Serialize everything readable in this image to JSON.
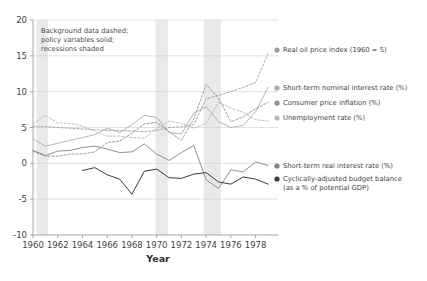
{
  "chart_data": {
    "type": "line",
    "title": "",
    "xlabel": "Year",
    "ylabel": "",
    "xlim": [
      1960,
      1979
    ],
    "ylim": [
      -10,
      20
    ],
    "xticks": [
      1960,
      1962,
      1964,
      1966,
      1968,
      1970,
      1972,
      1974,
      1976,
      1978
    ],
    "yticks": [
      -10,
      -5,
      0,
      5,
      10,
      15,
      20
    ],
    "xticklabels": [
      "1960",
      "1962",
      "1964",
      "1966",
      "1968",
      "1970",
      "1972",
      "1974",
      "1976",
      "1978"
    ],
    "yticklabels": [
      "-10",
      "-5",
      "0",
      "5",
      "10",
      "15",
      "20"
    ],
    "grid": true,
    "legend_position": "right",
    "annotation": {
      "lines": [
        "Background data dashed;",
        "policy variables solid;",
        "recessions shaded"
      ]
    },
    "recessions": [
      {
        "start": 1960.3,
        "end": 1961.2
      },
      {
        "start": 1969.9,
        "end": 1970.9
      },
      {
        "start": 1973.8,
        "end": 1975.2
      }
    ],
    "series": [
      {
        "name": "Real oil price index (1960 = 5)",
        "style": "dashed",
        "color": "#9aa0a6",
        "x": [
          1960,
          1961,
          1962,
          1963,
          1964,
          1965,
          1966,
          1967,
          1968,
          1969,
          1970,
          1971,
          1972,
          1973,
          1974,
          1975,
          1976,
          1977,
          1978,
          1979
        ],
        "values": [
          5.2,
          5.1,
          5.0,
          4.9,
          4.8,
          4.7,
          4.6,
          4.6,
          4.5,
          4.4,
          4.6,
          5.0,
          5.1,
          5.4,
          9.0,
          9.5,
          10.0,
          10.6,
          11.3,
          15.3
        ]
      },
      {
        "name": "Short-term nominal interest rate (%)",
        "style": "solid",
        "color": "#a7adb3",
        "x": [
          1960,
          1961,
          1962,
          1963,
          1964,
          1965,
          1966,
          1967,
          1968,
          1969,
          1970,
          1971,
          1972,
          1973,
          1974,
          1975,
          1976,
          1977,
          1978,
          1979
        ],
        "values": [
          3.4,
          2.4,
          2.8,
          3.2,
          3.6,
          4.0,
          4.9,
          4.3,
          5.4,
          6.7,
          6.4,
          4.3,
          4.1,
          7.0,
          7.9,
          5.8,
          5.0,
          5.3,
          7.2,
          10.6
        ]
      },
      {
        "name": "Consumer price inflation (%)",
        "style": "dashed",
        "color": "#8b9096",
        "x": [
          1960,
          1961,
          1962,
          1963,
          1964,
          1965,
          1966,
          1967,
          1968,
          1969,
          1970,
          1971,
          1972,
          1973,
          1974,
          1975,
          1976,
          1977,
          1978,
          1979
        ],
        "values": [
          1.7,
          1.0,
          1.0,
          1.3,
          1.3,
          1.6,
          2.9,
          3.1,
          4.2,
          5.5,
          5.7,
          4.4,
          3.2,
          6.2,
          11.0,
          9.1,
          5.8,
          6.5,
          7.6,
          8.5
        ]
      },
      {
        "name": "Unemployment rate (%)",
        "style": "dashed",
        "color": "#b4b9be",
        "x": [
          1960,
          1961,
          1962,
          1963,
          1964,
          1965,
          1966,
          1967,
          1968,
          1969,
          1970,
          1971,
          1972,
          1973,
          1974,
          1975,
          1976,
          1977,
          1978,
          1979
        ],
        "values": [
          5.5,
          6.7,
          5.6,
          5.6,
          5.2,
          4.5,
          3.8,
          3.8,
          3.6,
          3.5,
          4.9,
          5.9,
          5.6,
          4.9,
          5.6,
          8.5,
          7.7,
          7.1,
          6.1,
          5.9
        ]
      },
      {
        "name": "Short-term real interest rate (%)",
        "style": "solid",
        "color": "#7d838a",
        "x": [
          1960,
          1961,
          1962,
          1963,
          1964,
          1965,
          1966,
          1967,
          1968,
          1969,
          1970,
          1971,
          1972,
          1973,
          1974,
          1975,
          1976,
          1977,
          1978,
          1979
        ],
        "values": [
          1.8,
          1.1,
          1.7,
          1.8,
          2.2,
          2.4,
          2.0,
          1.5,
          1.6,
          2.7,
          1.3,
          0.4,
          1.5,
          2.5,
          -2.3,
          -3.5,
          -0.9,
          -1.2,
          0.2,
          -0.3
        ]
      },
      {
        "name": "Cyclically-adjusted budget balance",
        "name_line2": "(as a % of potential GDP)",
        "style": "solid",
        "color": "#3a3a3a",
        "x": [
          1964,
          1965,
          1966,
          1967,
          1968,
          1969,
          1970,
          1971,
          1972,
          1973,
          1974,
          1975,
          1976,
          1977,
          1978,
          1979
        ],
        "values": [
          -1.0,
          -0.6,
          -1.6,
          -2.2,
          -4.3,
          -1.1,
          -0.8,
          -2.0,
          -2.1,
          -1.5,
          -1.3,
          -2.6,
          -2.9,
          -1.9,
          -2.2,
          -2.9
        ]
      }
    ],
    "legend_entries": [
      {
        "label": "Real oil price index (1960 = 5)",
        "color": "#9aa0a6"
      },
      {
        "label": "Short-term nominal interest rate (%)",
        "color": "#a7adb3"
      },
      {
        "label": "Consumer price inflation (%)",
        "color": "#8b9096"
      },
      {
        "label": "Unemployment rate (%)",
        "color": "#b4b9be"
      },
      {
        "label": "Short-term real interest rate (%)",
        "color": "#7d838a"
      },
      {
        "label": "Cyclically-adjusted budget balance",
        "color": "#3a3a3a"
      },
      {
        "label": "(as a % of potential GDP)",
        "color": "#3a3a3a"
      }
    ]
  }
}
